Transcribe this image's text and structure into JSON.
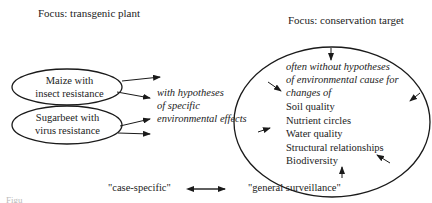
{
  "left": {
    "heading": "Focus: transgenic plant",
    "ovals": [
      {
        "line1": "Maize with",
        "line2": "insect resistance"
      },
      {
        "line1": "Sugarbeet with",
        "line2": "virus resistance"
      }
    ],
    "hypothesis": {
      "line1": "with hypotheses",
      "line2": "of specific",
      "line3": "environmental effects"
    }
  },
  "right": {
    "heading": "Focus: conservation target",
    "intro": {
      "line1": "often without hypotheses",
      "line2": "of environmental cause for",
      "line3": "changes of"
    },
    "targets": [
      "Soil quality",
      "Nutrient circles",
      "Water quality",
      "Structural relationships",
      "Biodiversity"
    ]
  },
  "bottom": {
    "left_label": "\"case-specific\"",
    "right_label": "\"general surveillance\"",
    "figure_fragment": "Figu"
  },
  "colors": {
    "stroke": "#1a1a1a",
    "text": "#222222",
    "background": "#ffffff"
  }
}
